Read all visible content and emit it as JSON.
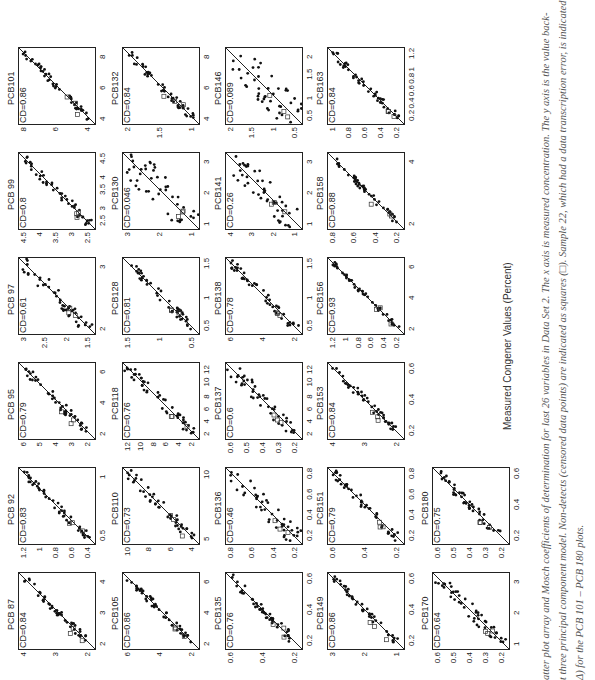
{
  "figure": {
    "x_axis_label": "Measured Congener Values (Percent)",
    "caption_lines": [
      "atter plot array and Mosch coefficients of determination for last 26 variables in Data Set 2. The x axis is measured concentration. The y axis is the value back-",
      "t three principal component model. Non-detects (censored data points) are indicated as squares (□). Sample 22, which had a data transcription error, is indicated",
      "Δ) for the PCB 101 – PCB 180 plots."
    ]
  },
  "chart_data": [
    {
      "type": "scatter",
      "title": "PCB 87",
      "cd": "CD=0.84",
      "xticks": [
        "2",
        "3",
        "4"
      ],
      "yticks": [
        "2",
        "3",
        "4"
      ],
      "xlim": [
        1.7,
        4.6
      ],
      "ylim": [
        1.7,
        4.6
      ]
    },
    {
      "type": "scatter",
      "title": "PCB 92",
      "cd": "CD=0.83",
      "xticks": [
        "0.5",
        "1"
      ],
      "yticks": [
        "0.4",
        "0.6",
        "0.8",
        "1",
        "1.2"
      ],
      "xlim": [
        0.35,
        1.25
      ],
      "ylim": [
        0.35,
        1.25
      ]
    },
    {
      "type": "scatter",
      "title": "PCB 95",
      "cd": "CD=0.79",
      "xticks": [
        "2",
        "4",
        "6"
      ],
      "yticks": [
        "2",
        "3",
        "4",
        "5",
        "6"
      ],
      "xlim": [
        1.4,
        6.6
      ],
      "ylim": [
        1.4,
        6.6
      ]
    },
    {
      "type": "scatter",
      "title": "PCB 97",
      "cd": "CD=0.61",
      "xticks": [
        "2",
        "3"
      ],
      "yticks": [
        "1.5",
        "2",
        "2.5",
        "3"
      ],
      "xlim": [
        1.35,
        3.3
      ],
      "ylim": [
        1.35,
        3.3
      ]
    },
    {
      "type": "scatter",
      "title": "PCB 99",
      "cd": "CD=0.8",
      "xticks": [
        "2.5",
        "3",
        "3.5",
        "4",
        "4.5"
      ],
      "yticks": [
        "2.5",
        "3",
        "3.5",
        "4",
        "4.5"
      ],
      "xlim": [
        2.2,
        4.7
      ],
      "ylim": [
        2.2,
        4.7
      ]
    },
    {
      "type": "scatter",
      "title": "PCB101",
      "cd": "CD=0.86",
      "xticks": [
        "4",
        "6",
        "8"
      ],
      "yticks": [
        "4",
        "6",
        "8"
      ],
      "xlim": [
        2.8,
        8.2
      ],
      "ylim": [
        2.8,
        8.2
      ]
    },
    {
      "type": "scatter",
      "title": "PCB105",
      "cd": "CD=0.86",
      "xticks": [
        "2",
        "4",
        "6"
      ],
      "yticks": [
        "2",
        "4",
        "6"
      ],
      "xlim": [
        1.8,
        7.2
      ],
      "ylim": [
        1.8,
        7.2
      ]
    },
    {
      "type": "scatter",
      "title": "PCB110",
      "cd": "CD=0.73",
      "xticks": [
        "5",
        "10"
      ],
      "yticks": [
        "4",
        "6",
        "8",
        "10"
      ],
      "xlim": [
        3.2,
        10.5
      ],
      "ylim": [
        3.2,
        10.5
      ]
    },
    {
      "type": "scatter",
      "title": "PCB118",
      "cd": "CD=0.76",
      "xticks": [
        "2",
        "4",
        "6",
        "8",
        "10",
        "12"
      ],
      "yticks": [
        "2",
        "4",
        "6",
        "8",
        "10",
        "12"
      ],
      "xlim": [
        1,
        13
      ],
      "ylim": [
        1,
        13
      ]
    },
    {
      "type": "scatter",
      "title": "PCB128",
      "cd": "CD=0.81",
      "xticks": [
        "0.5",
        "1",
        "1.5"
      ],
      "yticks": [
        "0.5",
        "1",
        "1.5"
      ],
      "xlim": [
        0.45,
        1.7
      ],
      "ylim": [
        0.45,
        1.7
      ]
    },
    {
      "type": "scatter",
      "title": "PCB130",
      "cd": "CD=0.046",
      "xticks": [
        "1",
        "2",
        "3"
      ],
      "yticks": [
        "1",
        "2",
        "3"
      ],
      "xlim": [
        0.2,
        3.6
      ],
      "ylim": [
        0.2,
        3.6
      ]
    },
    {
      "type": "scatter",
      "title": "PCB132",
      "cd": "CD=0.84",
      "xticks": [
        "4",
        "6",
        "8"
      ],
      "yticks": [
        "1",
        "1.5",
        "2"
      ],
      "xlim": [
        2.8,
        8.2
      ],
      "ylim": [
        0.6,
        2.2
      ]
    },
    {
      "type": "scatter",
      "title": "PCB135",
      "cd": "CD=0.76",
      "xticks": [
        "0.2",
        "0.4",
        "0.6"
      ],
      "yticks": [
        "0.2",
        "0.4",
        "0.6"
      ],
      "xlim": [
        0.05,
        0.7
      ],
      "ylim": [
        0.05,
        0.7
      ]
    },
    {
      "type": "scatter",
      "title": "PCB136",
      "cd": "CD=0.46",
      "xticks": [
        "0.2",
        "0.4",
        "0.6",
        "0.8"
      ],
      "yticks": [
        "0.2",
        "0.4",
        "0.6",
        "0.8"
      ],
      "xlim": [
        0.1,
        0.9
      ],
      "ylim": [
        0.1,
        0.9
      ]
    },
    {
      "type": "scatter",
      "title": "PCB137",
      "cd": "CD=0.6",
      "xticks": [
        "2",
        "4",
        "6",
        "8",
        "10",
        "12"
      ],
      "yticks": [
        "0.2",
        "0.3",
        "0.4",
        "0.5",
        "0.6"
      ],
      "xlim": [
        1,
        13
      ],
      "ylim": [
        0.1,
        0.68
      ]
    },
    {
      "type": "scatter",
      "title": "PCB138",
      "cd": "CD=0.78",
      "xticks": [
        "0.5",
        "1",
        "1.5"
      ],
      "yticks": [
        "2",
        "4",
        "6"
      ],
      "xlim": [
        0.2,
        1.7
      ],
      "ylim": [
        0.2,
        7.5
      ]
    },
    {
      "type": "scatter",
      "title": "PCB141",
      "cd": "CD=0.26",
      "xticks": [
        "1",
        "2",
        "3"
      ],
      "yticks": [
        "1",
        "2",
        "3",
        "4"
      ],
      "xlim": [
        0.3,
        3.6
      ],
      "ylim": [
        0.3,
        4.3
      ]
    },
    {
      "type": "scatter",
      "title": "PCB146",
      "cd": "CD=0.089",
      "xticks": [
        "0.5",
        "1",
        "1.5",
        "2"
      ],
      "yticks": [
        "0.5",
        "1",
        "1.5",
        "2"
      ],
      "xlim": [
        0.2,
        2.4
      ],
      "ylim": [
        0.2,
        2.4
      ]
    },
    {
      "type": "scatter",
      "title": "PCB149",
      "cd": "CD=0.86",
      "xticks": [
        "0.2",
        "0.4",
        "0.6"
      ],
      "yticks": [
        "1",
        "2",
        "3"
      ],
      "xlim": [
        0.05,
        0.75
      ],
      "ylim": [
        0.6,
        3.8
      ]
    },
    {
      "type": "scatter",
      "title": "PCB151",
      "cd": "CD=0.79",
      "xticks": [
        "0.2",
        "0.4",
        "0.6",
        "0.8"
      ],
      "yticks": [
        "0.2",
        "0.4",
        "0.6"
      ],
      "xlim": [
        0.1,
        0.9
      ],
      "ylim": [
        0.1,
        0.75
      ]
    },
    {
      "type": "scatter",
      "title": "PCB153",
      "cd": "CD=0.84",
      "xticks": [
        "0.2",
        "0.4",
        "0.6"
      ],
      "yticks": [
        "2",
        "3",
        "4"
      ],
      "xlim": [
        0.1,
        0.7
      ],
      "ylim": [
        1.2,
        4.1
      ]
    },
    {
      "type": "scatter",
      "title": "PCB156",
      "cd": "CD=0.93",
      "xticks": [
        "2",
        "4",
        "6"
      ],
      "yticks": [
        "0.2",
        "0.4",
        "0.6",
        "0.8",
        "1",
        "1.2"
      ],
      "xlim": [
        0.5,
        7
      ],
      "ylim": [
        0.1,
        1.25
      ]
    },
    {
      "type": "scatter",
      "title": "PCB158",
      "cd": "CD=0.88",
      "xticks": [
        "2",
        "4"
      ],
      "yticks": [
        "0.2",
        "0.4",
        "0.6",
        "0.8"
      ],
      "xlim": [
        0.3,
        4.7
      ],
      "ylim": [
        0.1,
        0.95
      ]
    },
    {
      "type": "scatter",
      "title": "PCB163",
      "cd": "CD=0.84",
      "xticks": [
        "0.2",
        "0.4",
        "0.6",
        "0.8",
        "1",
        "1.2"
      ],
      "yticks": [
        "0.2",
        "0.4",
        "0.6",
        "0.8",
        "1"
      ],
      "xlim": [
        0.1,
        1.25
      ],
      "ylim": [
        0.1,
        1.05
      ]
    },
    {
      "type": "scatter",
      "title": "PCB170",
      "cd": "CD=0.64",
      "xticks": [
        "1",
        "2",
        "3"
      ],
      "yticks": [
        "0.2",
        "0.3",
        "0.4",
        "0.5",
        "0.6"
      ],
      "xlim": [
        0.5,
        3.8
      ],
      "ylim": [
        0.12,
        0.68
      ]
    },
    {
      "type": "scatter",
      "title": "PCB180",
      "cd": "CD=0.75",
      "xticks": [
        "0.2",
        "0.4",
        "0.6"
      ],
      "yticks": [
        "0.2",
        "0.3",
        "0.4",
        "0.5",
        "0.6"
      ],
      "xlim": [
        0.12,
        0.7
      ],
      "ylim": [
        0.12,
        0.68
      ]
    }
  ]
}
